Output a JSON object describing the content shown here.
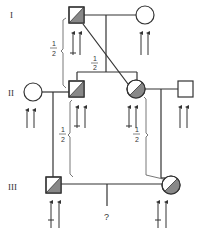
{
  "diagram": {
    "type": "pedigree",
    "generation_labels": [
      "I",
      "II",
      "III"
    ],
    "fractions": {
      "gen1_to_gen2_left": {
        "num": "1",
        "den": "2"
      },
      "gen1_diag_to_gen2_center": {
        "num": "1",
        "den": "2"
      },
      "gen2_left_to_gen3": {
        "num": "1",
        "den": "2"
      },
      "gen2_right_to_gen3": {
        "num": "1",
        "den": "2"
      }
    },
    "unknown_child": "?",
    "colors": {
      "line": "#333333",
      "shade": "#888888",
      "fill": "#ffffff"
    },
    "individuals": [
      {
        "id": "I-1",
        "generation": "I",
        "sex": "male",
        "status": "carrier (half-shaded)",
        "alleles": [
          "mutant",
          "normal"
        ]
      },
      {
        "id": "I-2",
        "generation": "I",
        "sex": "female",
        "status": "unaffected",
        "alleles": [
          "normal",
          "normal"
        ]
      },
      {
        "id": "II-1",
        "generation": "II",
        "sex": "female",
        "status": "unaffected",
        "alleles": [
          "normal",
          "normal"
        ]
      },
      {
        "id": "II-2",
        "generation": "II",
        "sex": "male",
        "status": "carrier (half-shaded)",
        "alleles": [
          "mutant",
          "normal"
        ]
      },
      {
        "id": "II-3",
        "generation": "II",
        "sex": "female",
        "status": "carrier (half-shaded)",
        "alleles": [
          "mutant",
          "normal"
        ]
      },
      {
        "id": "II-4",
        "generation": "II",
        "sex": "male",
        "status": "unaffected",
        "alleles": [
          "normal",
          "normal"
        ]
      },
      {
        "id": "III-1",
        "generation": "III",
        "sex": "male",
        "status": "carrier (half-shaded)",
        "alleles": [
          "mutant",
          "normal"
        ]
      },
      {
        "id": "III-2",
        "generation": "III",
        "sex": "female",
        "status": "carrier (half-shaded)",
        "alleles": [
          "mutant",
          "normal"
        ]
      }
    ]
  }
}
